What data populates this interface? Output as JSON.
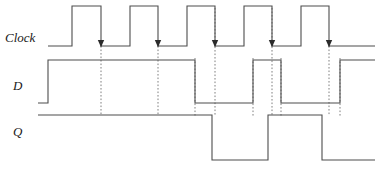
{
  "figure": {
    "type": "timing-diagram",
    "title": "",
    "background_color": "#ffffff",
    "wave_color": "#4d4d4d",
    "marker_color": "#808080",
    "arrow_color": "#2b2b2b",
    "width": 384,
    "height": 169
  },
  "signals": [
    {
      "name": "clock",
      "label": "Clock",
      "label_x": 5,
      "label_y": 42,
      "high_y": 6,
      "low_y": 46,
      "start_x": 48,
      "end_x": 375,
      "initial_level": "low",
      "transitions": [
        72,
        101,
        130,
        158,
        187,
        215,
        244,
        272,
        301,
        329
      ],
      "edge_kinds": [
        "rise",
        "fall",
        "rise",
        "fall",
        "rise",
        "fall",
        "rise",
        "fall",
        "rise",
        "fall"
      ]
    },
    {
      "name": "d",
      "label": "D",
      "label_x": 13,
      "label_y": 90,
      "high_y": 60,
      "low_y": 103,
      "start_x": 38,
      "end_x": 375,
      "initial_level": "low",
      "transitions": [
        48,
        195,
        253,
        281,
        340
      ],
      "edge_kinds": [
        "rise",
        "fall",
        "rise",
        "fall",
        "rise"
      ]
    },
    {
      "name": "q",
      "label": "Q",
      "label_x": 13,
      "label_y": 136,
      "high_y": 115,
      "low_y": 160,
      "start_x": 38,
      "end_x": 375,
      "initial_level": "high",
      "transitions": [
        212,
        268,
        322
      ],
      "edge_kinds": [
        "fall",
        "rise",
        "fall"
      ]
    }
  ],
  "clock_edge_arrows": [
    {
      "x": 101,
      "y": 46,
      "edge": "falling",
      "clock_index": 1
    },
    {
      "x": 158,
      "y": 46,
      "edge": "falling",
      "clock_index": 2
    },
    {
      "x": 215,
      "y": 46,
      "edge": "falling",
      "clock_index": 3
    },
    {
      "x": 272,
      "y": 46,
      "edge": "falling",
      "clock_index": 4
    },
    {
      "x": 329,
      "y": 46,
      "edge": "falling",
      "clock_index": 5
    }
  ],
  "marker_lines": [
    {
      "name": "edge-marker-1",
      "x": 101,
      "y1": 46,
      "y2": 116
    },
    {
      "name": "edge-marker-2",
      "x": 158,
      "y1": 46,
      "y2": 116
    },
    {
      "name": "edge-marker-3",
      "x": 215,
      "y1": 8,
      "y2": 116
    },
    {
      "name": "edge-marker-4",
      "x": 272,
      "y1": 8,
      "y2": 116
    },
    {
      "name": "edge-marker-5",
      "x": 329,
      "y1": 46,
      "y2": 116
    },
    {
      "name": "data-marker-1",
      "x": 195,
      "y1": 58,
      "y2": 116
    },
    {
      "name": "data-marker-2",
      "x": 253,
      "y1": 58,
      "y2": 116
    },
    {
      "name": "data-marker-3",
      "x": 281,
      "y1": 58,
      "y2": 116
    },
    {
      "name": "data-marker-4",
      "x": 340,
      "y1": 58,
      "y2": 116
    }
  ],
  "chart_data": {
    "type": "line",
    "xlabel": "",
    "ylabel": "",
    "x": [
      38,
      48,
      72,
      101,
      130,
      158,
      187,
      195,
      212,
      215,
      244,
      253,
      268,
      272,
      281,
      301,
      322,
      329,
      340,
      375
    ],
    "series": [
      {
        "name": "Clock",
        "levels": [
          0,
          0,
          1,
          0,
          1,
          0,
          1,
          1,
          1,
          0,
          1,
          1,
          1,
          0,
          0,
          1,
          1,
          0,
          0,
          0
        ]
      },
      {
        "name": "D",
        "levels": [
          0,
          1,
          1,
          1,
          1,
          1,
          1,
          0,
          0,
          0,
          0,
          1,
          1,
          1,
          0,
          0,
          0,
          0,
          1,
          1
        ]
      },
      {
        "name": "Q",
        "levels": [
          1,
          1,
          1,
          1,
          1,
          1,
          1,
          1,
          0,
          0,
          0,
          0,
          1,
          1,
          1,
          1,
          0,
          0,
          0,
          0
        ]
      }
    ],
    "legend": [
      "Clock",
      "D",
      "Q"
    ],
    "grid": false,
    "annotations": [
      "Falling-edge arrows on clock at x = 101, 158, 215, 272, 329",
      "Dotted vertical markers align clock edges with D and Q transitions"
    ]
  }
}
